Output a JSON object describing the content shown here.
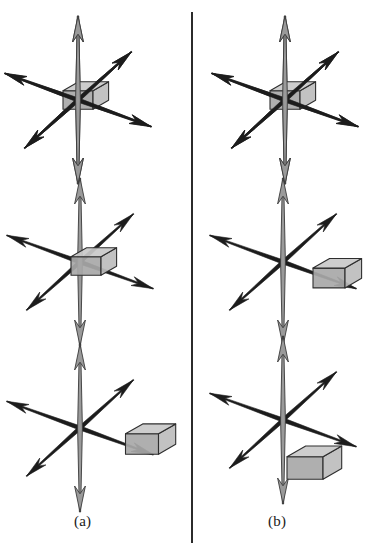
{
  "figure": {
    "kind": "line-drawing",
    "background_color": "#ffffff",
    "divider": {
      "name": "column-divider",
      "color": "#2b2b2b",
      "x": 191,
      "top": 12,
      "height": 531
    },
    "captions": [
      {
        "id": "a",
        "label": "(a)",
        "x": 74,
        "y": 513
      },
      {
        "id": "b",
        "label": "(b)",
        "x": 268,
        "y": 513
      }
    ],
    "colors": {
      "axis_dark": "#1c1c1c",
      "axis_vertical_fill": "#9a9a9a",
      "axis_vertical_stroke": "#3a3a3a",
      "cube_top": "#c9c9c9",
      "cube_left": "#a8a8a8",
      "cube_right": "#bdbdbd",
      "cube_stroke": "#2e2e2e",
      "caption_color": "#1a1a1a"
    },
    "axes": [
      {
        "name": "vertical-axis",
        "style": "outlined-gray-spear",
        "angle_deg": 90
      },
      {
        "name": "diagonal-axis-major",
        "style": "solid-black-spear",
        "angle_deg": 20
      },
      {
        "name": "diagonal-axis-minor",
        "style": "solid-black-spear",
        "angle_deg": -42
      }
    ],
    "panels": [
      {
        "id": "a1",
        "column": "a",
        "row": 1,
        "origin": {
          "x": 78,
          "y": 100
        },
        "cube": {
          "offset_x": 0,
          "offset_y": 0,
          "size": 30,
          "position_label": "centered-at-origin"
        }
      },
      {
        "id": "a2",
        "column": "a",
        "row": 2,
        "origin": {
          "x": 80,
          "y": 262
        },
        "cube": {
          "offset_x": 6,
          "offset_y": 4,
          "size": 30,
          "position_label": "slightly-offset-from-origin"
        }
      },
      {
        "id": "a3",
        "column": "a",
        "row": 3,
        "origin": {
          "x": 80,
          "y": 428
        },
        "cube": {
          "offset_x": 62,
          "offset_y": 16,
          "size": 33,
          "position_label": "displaced-right-along-axis"
        }
      },
      {
        "id": "b1",
        "column": "b",
        "row": 1,
        "origin": {
          "x": 285,
          "y": 100
        },
        "cube": {
          "offset_x": 0,
          "offset_y": 0,
          "size": 30,
          "position_label": "centered-at-origin"
        }
      },
      {
        "id": "b2",
        "column": "b",
        "row": 2,
        "origin": {
          "x": 283,
          "y": 262
        },
        "cube": {
          "offset_x": 46,
          "offset_y": 16,
          "size": 32,
          "position_label": "displaced-right-of-origin"
        }
      },
      {
        "id": "b3",
        "column": "b",
        "row": 3,
        "origin": {
          "x": 283,
          "y": 420
        },
        "cube": {
          "offset_x": 22,
          "offset_y": 48,
          "size": 36,
          "position_label": "displaced-down-right-of-origin"
        }
      }
    ]
  }
}
